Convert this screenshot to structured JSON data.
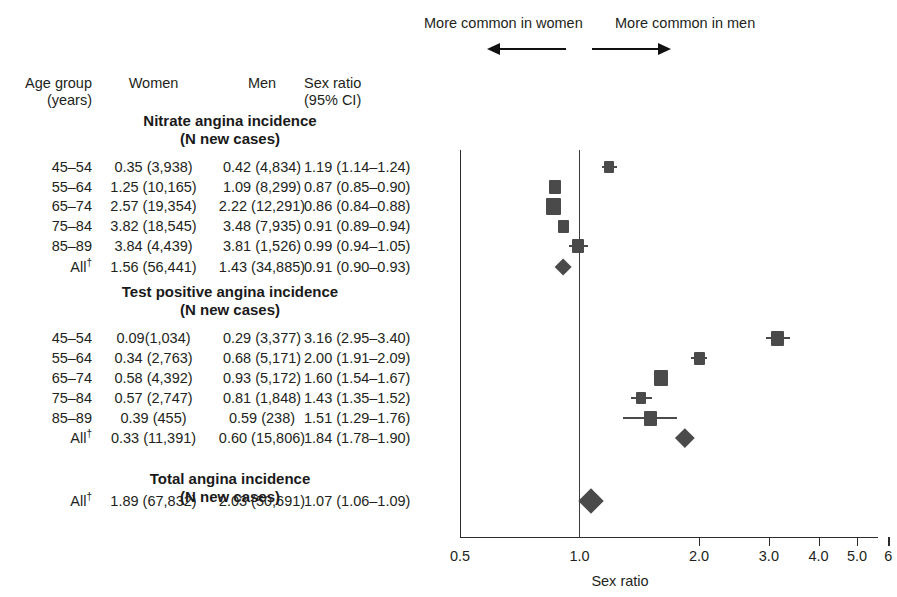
{
  "figure": {
    "axis_title": "Sex ratio",
    "annotation_left": "More common in women",
    "annotation_right": "More common in men"
  },
  "table": {
    "headers": {
      "age_line1": "Age group",
      "age_line2": "(years)",
      "women": "Women",
      "men": "Men",
      "ratio_line1": "Sex ratio",
      "ratio_line2": "(95% CI)"
    },
    "sections": [
      {
        "title": "Nitrate angina incidence",
        "subtitle": "(N new cases)",
        "rows": [
          {
            "age": "45–54",
            "women": "0.35 (3,938)",
            "men": "0.42 (4,834)",
            "ratio": "1.19 (1.14–1.24)"
          },
          {
            "age": "55–64",
            "women": "1.25 (10,165)",
            "men": "1.09 (8,299)",
            "ratio": "0.87 (0.85–0.90)"
          },
          {
            "age": "65–74",
            "women": "2.57 (19,354)",
            "men": "2.22 (12,291)",
            "ratio": "0.86 (0.84–0.88)"
          },
          {
            "age": "75–84",
            "women": "3.82 (18,545)",
            "men": "3.48 (7,935)",
            "ratio": "0.91 (0.89–0.94)"
          },
          {
            "age": "85–89",
            "women": "3.84 (4,439)",
            "men": "3.81 (1,526)",
            "ratio": "0.99 (0.94–1.05)"
          },
          {
            "age": "All",
            "age_dagger": true,
            "women": "1.56 (56,441)",
            "men": "1.43 (34,885)",
            "ratio": "0.91 (0.90–0.93)"
          }
        ]
      },
      {
        "title": "Test positive angina incidence",
        "subtitle": "(N new cases)",
        "rows": [
          {
            "age": "45–54",
            "women": "0.09(1,034)",
            "men": "0.29 (3,377)",
            "ratio": "3.16 (2.95–3.40)"
          },
          {
            "age": "55–64",
            "women": "0.34 (2,763)",
            "men": "0.68 (5,171)",
            "ratio": "2.00 (1.91–2.09)"
          },
          {
            "age": "65–74",
            "women": "0.58 (4,392)",
            "men": "0.93 (5,172)",
            "ratio": "1.60 (1.54–1.67)"
          },
          {
            "age": "75–84",
            "women": "0.57 (2,747)",
            "men": "0.81 (1,848)",
            "ratio": "1.43 (1.35–1.52)"
          },
          {
            "age": "85–89",
            "women": "0.39 (455)",
            "men": "0.59 (238)",
            "ratio": "1.51 (1.29–1.76)"
          },
          {
            "age": "All",
            "age_dagger": true,
            "women": "0.33 (11,391)",
            "men": "0.60 (15,806)",
            "ratio": "1.84 (1.78–1.90)"
          }
        ]
      },
      {
        "title": "Total angina incidence",
        "subtitle": "(N new cases)",
        "rows": [
          {
            "age": "All",
            "age_dagger": true,
            "women": "1.89 (67,832)",
            "men": "2.03 (50,691)",
            "ratio": "1.07 (1.06–1.09)"
          }
        ]
      }
    ]
  },
  "chart_data": {
    "type": "scatter",
    "title": "",
    "xlabel": "Sex ratio",
    "ylabel": "",
    "scale": "log",
    "xlim": [
      0.5,
      6.4
    ],
    "grid": false,
    "reference_line": 1.0,
    "tick_values": [
      0.5,
      1.0,
      2.0,
      3.0,
      4.0,
      5.0,
      6.0
    ],
    "tick_labels": [
      "0.5",
      "1.0",
      "2.0",
      "3.0",
      "4.0",
      "5.0",
      "6"
    ],
    "annotations": [
      {
        "text": "More common in women",
        "direction": "left"
      },
      {
        "text": "More common in men",
        "direction": "right"
      }
    ],
    "marker_color": "#4a4a4a",
    "series": [
      {
        "name": "Nitrate angina incidence",
        "points": [
          {
            "label": "45–54",
            "value": 1.19,
            "ci_low": 1.14,
            "ci_high": 1.24,
            "marker": "square",
            "size": 10
          },
          {
            "label": "55–64",
            "value": 0.87,
            "ci_low": 0.85,
            "ci_high": 0.9,
            "marker": "square",
            "size": 12
          },
          {
            "label": "65–74",
            "value": 0.86,
            "ci_low": 0.84,
            "ci_high": 0.88,
            "marker": "square",
            "size": 15
          },
          {
            "label": "75–84",
            "value": 0.91,
            "ci_low": 0.89,
            "ci_high": 0.94,
            "marker": "square",
            "size": 11
          },
          {
            "label": "85–89",
            "value": 0.99,
            "ci_low": 0.94,
            "ci_high": 1.05,
            "marker": "square",
            "size": 12
          },
          {
            "label": "All",
            "value": 0.91,
            "ci_low": 0.9,
            "ci_high": 0.93,
            "marker": "diamond",
            "size": 17
          }
        ]
      },
      {
        "name": "Test positive angina incidence",
        "points": [
          {
            "label": "45–54",
            "value": 3.16,
            "ci_low": 2.95,
            "ci_high": 3.4,
            "marker": "square",
            "size": 13
          },
          {
            "label": "55–64",
            "value": 2.0,
            "ci_low": 1.91,
            "ci_high": 2.09,
            "marker": "square",
            "size": 11
          },
          {
            "label": "65–74",
            "value": 1.6,
            "ci_low": 1.54,
            "ci_high": 1.67,
            "marker": "square",
            "size": 14
          },
          {
            "label": "75–84",
            "value": 1.43,
            "ci_low": 1.35,
            "ci_high": 1.52,
            "marker": "square",
            "size": 10
          },
          {
            "label": "85–89",
            "value": 1.51,
            "ci_low": 1.29,
            "ci_high": 1.76,
            "marker": "square",
            "size": 13
          },
          {
            "label": "All",
            "value": 1.84,
            "ci_low": 1.78,
            "ci_high": 1.9,
            "marker": "diamond",
            "size": 19
          }
        ]
      },
      {
        "name": "Total angina incidence",
        "points": [
          {
            "label": "All",
            "value": 1.07,
            "ci_low": 1.06,
            "ci_high": 1.09,
            "marker": "diamond",
            "size": 25
          }
        ]
      }
    ]
  }
}
